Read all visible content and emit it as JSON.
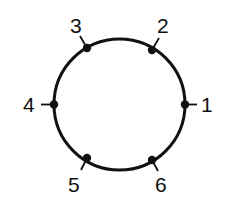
{
  "diagram": {
    "type": "circle-with-numbered-points",
    "circle": {
      "cx": 119.5,
      "cy": 104.5,
      "r": 65.5,
      "stroke": "#111111"
    },
    "points": [
      {
        "label": "1",
        "px": 185,
        "py": 104.5,
        "tx1": 185,
        "ty1": 104.5,
        "tx2": 197,
        "ty2": 104.5,
        "lx": 201,
        "ly": 112
      },
      {
        "label": "2",
        "px": 152,
        "py": 50,
        "tx1": 152,
        "ty1": 50,
        "tx2": 159,
        "ty2": 38,
        "lx": 157,
        "ly": 33
      },
      {
        "label": "3",
        "px": 87,
        "py": 48,
        "tx1": 87,
        "ty1": 48,
        "tx2": 80,
        "ty2": 36,
        "lx": 70,
        "ly": 33
      },
      {
        "label": "4",
        "px": 54,
        "py": 104.5,
        "tx1": 54,
        "ty1": 104.5,
        "tx2": 41,
        "ty2": 104.5,
        "lx": 23,
        "ly": 112
      },
      {
        "label": "5",
        "px": 87,
        "py": 158,
        "tx1": 87,
        "ty1": 158,
        "tx2": 81,
        "ty2": 170,
        "lx": 68,
        "ly": 192
      },
      {
        "label": "6",
        "px": 152,
        "py": 160,
        "tx1": 152,
        "ty1": 160,
        "tx2": 158,
        "ty2": 171,
        "lx": 155,
        "ly": 192
      }
    ]
  }
}
